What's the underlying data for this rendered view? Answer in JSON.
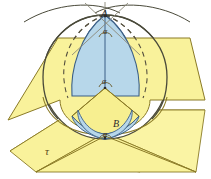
{
  "figure": {
    "type": "geometry-diagram",
    "width": 211,
    "height": 179,
    "background": "#ffffff"
  },
  "colors": {
    "sphere_fill": "#ffffff",
    "lune_fill": "#b7d7ea",
    "plane_fill": "#f9f29b",
    "plane_fill_shaded": "#f4ea84",
    "outline": "#4a4a3a",
    "outline_blue": "#3b5f86",
    "outline_yellow": "#8a7a26",
    "label_color": "#2b2b2b",
    "dashed_color": "#55503f"
  },
  "labels": {
    "pole_top": "A",
    "pole_bottom": "B",
    "angle_top": "α",
    "angle_center": "α",
    "angle_bottom": "α",
    "plane_tau": "τ"
  },
  "elements": {
    "sphere": "sphere-outline",
    "lune": "spherical-lune-blue",
    "upper_plane": "yellow-plane-upper",
    "lower_plane": "yellow-plane-lower-tau",
    "equator_dashed": "dashed-equator-arc",
    "meridian_dashed": "dashed-meridian-arc",
    "tangent_arcs": "great-circle-tangent-arcs-at-pole"
  }
}
